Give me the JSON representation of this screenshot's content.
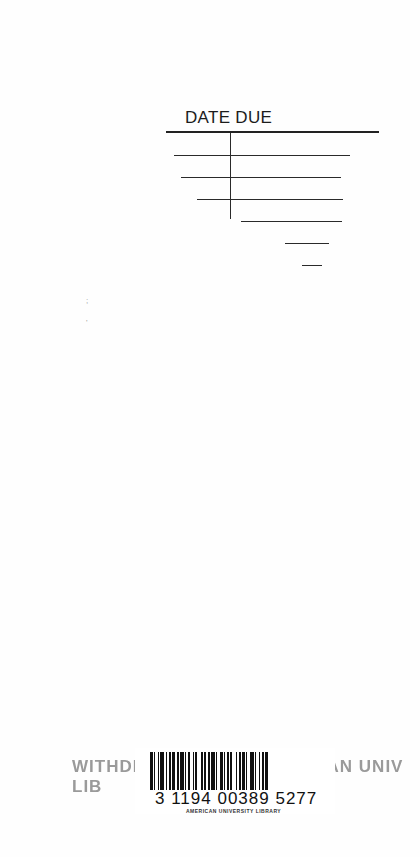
{
  "slip": {
    "title": "DATE DUE"
  },
  "margin_marks": [
    ";",
    "'"
  ],
  "stamp": {
    "text": "WITHDRAWN FROM AMERICAN UNIV LIB"
  },
  "barcode": {
    "number": "3 1194 00389 5277",
    "library": "AMERICAN UNIVERSITY LIBRARY",
    "pattern": [
      2,
      1,
      1,
      2,
      1,
      1,
      3,
      1,
      1,
      2,
      1,
      1,
      2,
      2,
      1,
      1,
      3,
      1,
      1,
      1,
      2,
      2,
      1,
      1,
      1,
      3,
      2,
      1,
      1,
      2,
      1,
      1,
      3,
      1,
      1,
      2,
      2,
      1,
      1,
      1,
      2,
      1,
      1,
      3,
      1,
      2,
      1,
      1,
      2,
      1,
      1,
      2,
      3,
      1,
      1,
      2,
      1,
      1,
      2,
      1,
      2,
      1
    ]
  },
  "colors": {
    "ink": "#1c1c1c",
    "stamp": "#9a9a9a",
    "paper": "#fefefe"
  }
}
